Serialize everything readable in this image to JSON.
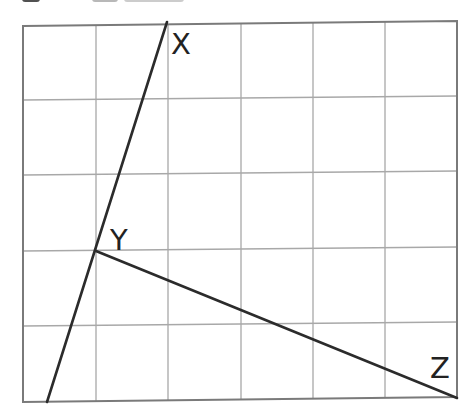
{
  "diagram": {
    "grid": {
      "columns": 6,
      "rows": 5,
      "x_lines": [
        23,
        96,
        168,
        241,
        313,
        385,
        457
      ],
      "y_lines": [
        25,
        100,
        175,
        251,
        326,
        401
      ],
      "line_color": "#a8a8a8",
      "border_color": "#7a7a7a"
    },
    "points": {
      "X": {
        "label": "X",
        "x": 167,
        "y": 24
      },
      "Y": {
        "label": "Y",
        "x": 95,
        "y": 251
      },
      "Z": {
        "label": "Z",
        "x": 457,
        "y": 398
      },
      "line_start": {
        "x": 47,
        "y": 401
      }
    },
    "segments": [
      {
        "name": "line-through-x-and-y",
        "from": "line_start",
        "to": "X"
      },
      {
        "name": "segment-yz",
        "from": "Y",
        "to": "Z"
      }
    ],
    "labels": {
      "x": "X",
      "y": "Y",
      "z": "Z"
    },
    "stroke_color": "#2b2b2b"
  }
}
